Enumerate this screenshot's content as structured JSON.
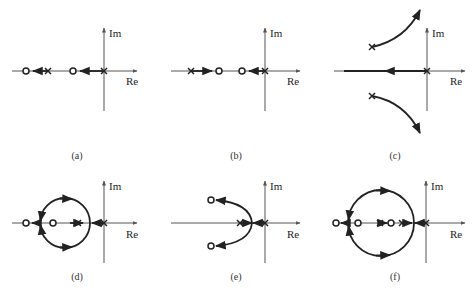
{
  "axis_labels": {
    "im": "Im",
    "re": "Re"
  },
  "panels": [
    {
      "id": "a",
      "caption": "(a)"
    },
    {
      "id": "b",
      "caption": "(b)"
    },
    {
      "id": "c",
      "caption": "(c)"
    },
    {
      "id": "d",
      "caption": "(d)"
    },
    {
      "id": "e",
      "caption": "(e)"
    },
    {
      "id": "f",
      "caption": "(f)"
    }
  ],
  "legend": {
    "pole_symbol": "×",
    "zero_symbol": "○"
  }
}
